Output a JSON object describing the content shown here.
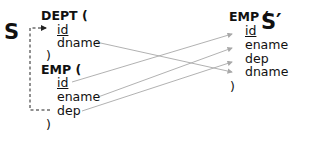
{
  "source_schema": {
    "label": "S",
    "tables": [
      {
        "name": "DEPT (",
        "attributes": [
          {
            "name": "id",
            "key": true
          },
          {
            "name": "dname",
            "key": false
          }
        ],
        "close": ")"
      },
      {
        "name": "EMP (",
        "attributes": [
          {
            "name": "id",
            "key": true
          },
          {
            "name": "ename",
            "key": false
          },
          {
            "name": "dep",
            "key": false
          }
        ],
        "close": ")"
      }
    ]
  },
  "target_schema": {
    "label": "S′",
    "tables": [
      {
        "name": "EMP (",
        "attributes": [
          {
            "name": "id",
            "key": true
          },
          {
            "name": "ename",
            "key": false
          },
          {
            "name": "dep",
            "key": false
          },
          {
            "name": "dname",
            "key": false
          }
        ],
        "close": ")"
      }
    ]
  },
  "mappings": [
    {
      "from": "DEPT.dname",
      "to": "EMP'.dname"
    },
    {
      "from": "EMP.id",
      "to": "EMP'.id"
    },
    {
      "from": "EMP.ename",
      "to": "EMP'.ename"
    },
    {
      "from": "EMP.dep",
      "to": "EMP'.dep"
    }
  ],
  "foreign_key": {
    "from": "EMP.dep",
    "to": "DEPT.id",
    "style": "dashed"
  },
  "colors": {
    "text": "#111111",
    "mapping_line": "#a8a8a8",
    "fk_line": "#333333"
  }
}
